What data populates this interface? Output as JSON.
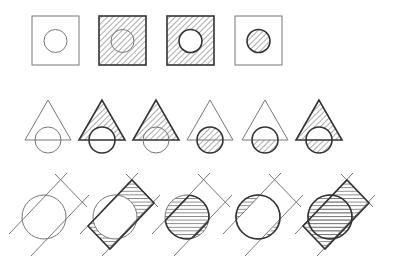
{
  "colors": {
    "stroke_thin": "#777777",
    "stroke_bold": "#333333",
    "hatch": "#666666",
    "background": "#ffffff"
  },
  "rows": [
    {
      "name": "square-circle",
      "shapes": [
        {
          "x": 0,
          "square_fill": false,
          "square_bold": false,
          "circle_fill": false,
          "circle_bold": false,
          "circle_white": false
        },
        {
          "x": 67,
          "square_fill": true,
          "square_bold": true,
          "circle_fill": false,
          "circle_bold": false,
          "circle_white": false
        },
        {
          "x": 135,
          "square_fill": true,
          "square_bold": true,
          "circle_fill": false,
          "circle_bold": true,
          "circle_white": true
        },
        {
          "x": 203,
          "square_fill": false,
          "square_bold": false,
          "circle_fill": true,
          "circle_bold": true,
          "circle_white": false
        }
      ]
    },
    {
      "name": "triangle-circle",
      "shapes": [
        {
          "x": 0,
          "mode": "none"
        },
        {
          "x": 54,
          "mode": "union"
        },
        {
          "x": 108,
          "mode": "triangle"
        },
        {
          "x": 162,
          "mode": "circle"
        },
        {
          "x": 217,
          "mode": "intersection"
        },
        {
          "x": 271,
          "mode": "xor"
        }
      ]
    },
    {
      "name": "band-circle",
      "shapes": [
        {
          "x": 0,
          "mode": "none"
        },
        {
          "x": 71,
          "mode": "band-minus-circle"
        },
        {
          "x": 143,
          "mode": "intersection"
        },
        {
          "x": 214,
          "mode": "circle-minus-band"
        },
        {
          "x": 286,
          "mode": "union"
        }
      ]
    }
  ]
}
